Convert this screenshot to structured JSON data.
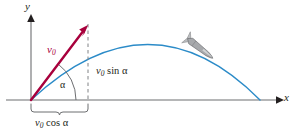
{
  "figure": {
    "background_color": "#ffffff",
    "width": 293,
    "height": 131
  },
  "axes": {
    "x_label": "x",
    "y_label": "y",
    "axis_color": "#6d6e71",
    "origin": {
      "x": 31,
      "y": 100
    },
    "x_axis_end": {
      "x": 283,
      "y": 100
    },
    "y_axis_top": {
      "x": 31,
      "y": 14
    }
  },
  "vector": {
    "label": "v",
    "label_subscript": "0",
    "color": "#a8003c",
    "tail": {
      "x": 31,
      "y": 100
    },
    "tip": {
      "x": 88,
      "y": 25
    }
  },
  "angle": {
    "label": "α",
    "arc_color": "#6d6e71",
    "value_degrees": 53
  },
  "components": {
    "horizontal": {
      "label_v": "v",
      "label_sub": "0",
      "label_fn": "cos",
      "label_angle": "α",
      "full_text": "v0 cos α",
      "brace_color": "#6d6e71",
      "from_x": 31,
      "to_x": 88
    },
    "vertical": {
      "label_v": "v",
      "label_sub": "0",
      "label_fn": "sin",
      "label_angle": "α",
      "full_text": "v0 sin α",
      "dash_color": "#808285",
      "at_x": 88,
      "from_y": 25,
      "to_y": 100
    }
  },
  "trajectory": {
    "color": "#2b8bc8",
    "launch": {
      "x": 31,
      "y": 100
    },
    "apex": {
      "x": 150,
      "y": 30
    },
    "landing": {
      "x": 260,
      "y": 100
    }
  },
  "projectile": {
    "icon_name": "rocket-icon",
    "color": "#a7a9ac",
    "outline_color": "#6d6e71",
    "position": {
      "x": 201,
      "y": 49
    },
    "heading_degrees": 38
  }
}
